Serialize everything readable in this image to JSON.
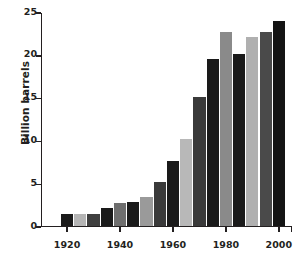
{
  "chart_data": {
    "type": "bar",
    "title": "",
    "xlabel": "",
    "ylabel": "Billion barrels",
    "ylim": [
      0,
      25
    ],
    "yticks": [
      0,
      5,
      10,
      15,
      20,
      25
    ],
    "ytick_labels": [
      "0",
      "5",
      "10",
      "15",
      "20",
      "25"
    ],
    "xticks": [
      1920,
      1940,
      1960,
      1980,
      2000
    ],
    "xtick_labels": [
      "1920",
      "1940",
      "1960",
      "1980",
      "2000"
    ],
    "grid": false,
    "legend": null,
    "categories": [
      "1920",
      "1925",
      "1930",
      "1935",
      "1940",
      "1945",
      "1950",
      "1955",
      "1960",
      "1965",
      "1970",
      "1975",
      "1980",
      "1985",
      "1990",
      "1995",
      "2000"
    ],
    "values": [
      1.3,
      1.3,
      1.4,
      2.1,
      2.7,
      2.8,
      3.4,
      5.1,
      7.6,
      10.1,
      15.0,
      19.5,
      22.6,
      20.0,
      22.0,
      22.6,
      23.9
    ],
    "bar_colors": [
      "#1a1a1a",
      "#b5b5b5",
      "#3f3f3f",
      "#1a1a1a",
      "#6e6e6e",
      "#1a1a1a",
      "#9a9a9a",
      "#3a3a3a",
      "#1a1a1a",
      "#b8b8b8",
      "#3a3a3a",
      "#1a1a1a",
      "#8a8a8a",
      "#1a1a1a",
      "#b0b0b0",
      "#4a4a4a",
      "#141414"
    ],
    "axis_color": "#231f20",
    "background": "#ffffff"
  },
  "accessibility": {
    "chart_name": "world-oil-production-bar-chart"
  }
}
